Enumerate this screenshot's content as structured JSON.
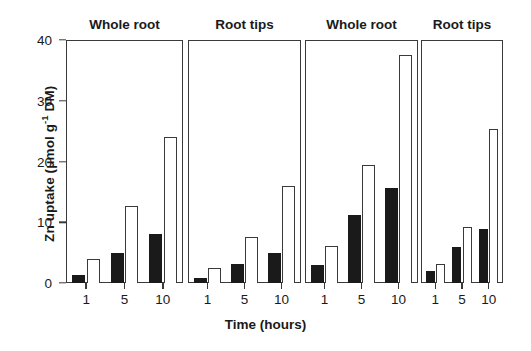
{
  "chart_data": {
    "type": "bar",
    "title": "",
    "xlabel": "Time (hours)",
    "ylabel": "Zn uptake (μmol g⁻¹ DM)",
    "ylabel_main": "Zn uptake (μmol g",
    "ylabel_sup": "-1",
    "ylabel_tail": " DM)",
    "categories": [
      "1",
      "5",
      "10"
    ],
    "ylim": [
      0,
      40
    ],
    "yticks": [
      0,
      10,
      20,
      30,
      40
    ],
    "ytick_labels": [
      "0",
      "10",
      "20",
      "30",
      "40"
    ],
    "grid": false,
    "legend": "none",
    "series_styles": [
      {
        "name": "filled",
        "fill": "#1a1a1a",
        "stroke": "#1a1a1a"
      },
      {
        "name": "open",
        "fill": "#ffffff",
        "stroke": "#3a3a3a"
      }
    ],
    "panels": [
      {
        "title": "Whole root",
        "series": [
          {
            "name": "filled",
            "values": [
              1.4,
              5.0,
              8.1
            ]
          },
          {
            "name": "open",
            "values": [
              4.0,
              12.6,
              24.1
            ]
          }
        ]
      },
      {
        "title": "Root tips",
        "series": [
          {
            "name": "filled",
            "values": [
              0.9,
              3.2,
              5.0
            ]
          },
          {
            "name": "open",
            "values": [
              2.5,
              7.5,
              16.0
            ]
          }
        ]
      },
      {
        "title": "Whole root",
        "series": [
          {
            "name": "filled",
            "values": [
              3.0,
              11.2,
              15.6
            ]
          },
          {
            "name": "open",
            "values": [
              6.1,
              19.4,
              37.5
            ]
          }
        ]
      },
      {
        "title": "Root tips",
        "series": [
          {
            "name": "filled",
            "values": [
              2.0,
              5.9,
              8.9
            ]
          },
          {
            "name": "open",
            "values": [
              3.1,
              9.3,
              25.4
            ]
          }
        ]
      }
    ]
  },
  "layout": {
    "panel_geometry": [
      {
        "left": 66,
        "width": 117
      },
      {
        "left": 188,
        "width": 113
      },
      {
        "left": 305,
        "width": 113
      },
      {
        "left": 421,
        "width": 82
      }
    ]
  }
}
